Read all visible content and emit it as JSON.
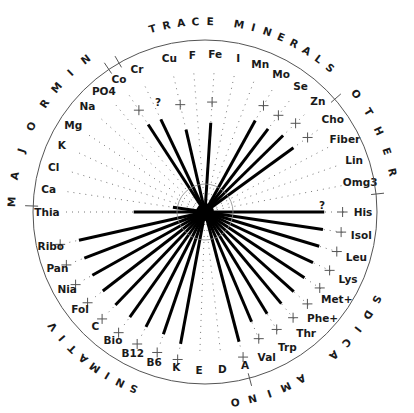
{
  "chart_data": {
    "type": "radial-spoke",
    "title": "",
    "center": [
      205,
      212
    ],
    "outer_radius": 172,
    "reference_radius": 108,
    "inner_circle_radius": 28,
    "reference_marker": "+",
    "value_scale": "spoke length relative to '+' reference (100%)",
    "groups": [
      {
        "name": "MAJOR MIN",
        "label": "MAJOR MIN"
      },
      {
        "name": "TRACE MINERALS",
        "label": "TRACE MINERALS"
      },
      {
        "name": "OTHER",
        "label": "OTHER"
      },
      {
        "name": "AMINO ACIDS",
        "label": "AMINO ACIDS"
      },
      {
        "name": "VITAMINS",
        "label": "VITAMINS"
      }
    ],
    "spokes": [
      {
        "label": "Thia",
        "angle": 180,
        "value": 0.66,
        "marker": false,
        "group": "VITAMINS"
      },
      {
        "label": "Ca",
        "angle": 171.6,
        "value": 0.3,
        "marker": false,
        "dotted": true,
        "group": "MAJOR MIN"
      },
      {
        "label": "Cl",
        "angle": 163.3,
        "value": 0.0,
        "marker": false,
        "dotted": true,
        "group": "MAJOR MIN"
      },
      {
        "label": "K",
        "angle": 154.9,
        "value": 0.0,
        "marker": false,
        "dotted": true,
        "group": "MAJOR MIN"
      },
      {
        "label": "Mg",
        "angle": 146.5,
        "value": 0.0,
        "marker": false,
        "dotted": true,
        "group": "MAJOR MIN"
      },
      {
        "label": "Na",
        "angle": 138.1,
        "value": 0.0,
        "marker": false,
        "dotted": true,
        "group": "MAJOR MIN"
      },
      {
        "label": "PO4",
        "angle": 129.8,
        "value": 0.0,
        "marker": false,
        "dotted": true,
        "group": "MAJOR MIN"
      },
      {
        "label": "Co",
        "angle": 123.0,
        "value": 1.05,
        "marker": true,
        "group": "TRACE MINERALS"
      },
      {
        "label": "Cr",
        "angle": 115.5,
        "value": 0.95,
        "marker": false,
        "note": "?",
        "group": "TRACE MINERALS"
      },
      {
        "label": "Cu",
        "angle": 103.0,
        "value": 0.85,
        "marker": true,
        "group": "TRACE MINERALS"
      },
      {
        "label": "F",
        "angle": 94.6,
        "value": 0.0,
        "marker": false,
        "dotted": true,
        "group": "TRACE MINERALS"
      },
      {
        "label": "Fe",
        "angle": 86.3,
        "value": 0.9,
        "marker": true,
        "group": "TRACE MINERALS"
      },
      {
        "label": "I",
        "angle": 77.9,
        "value": 0.0,
        "marker": false,
        "dotted": true,
        "group": "TRACE MINERALS"
      },
      {
        "label": "Mn",
        "angle": 69.5,
        "value": 0.0,
        "marker": false,
        "dotted": true,
        "group": "TRACE MINERALS"
      },
      {
        "label": "Mo",
        "angle": 61.2,
        "value": 1.05,
        "marker": true,
        "group": "TRACE MINERALS"
      },
      {
        "label": "Se",
        "angle": 52.8,
        "value": 1.05,
        "marker": true,
        "group": "TRACE MINERALS"
      },
      {
        "label": "Zn",
        "angle": 44.4,
        "value": 1.1,
        "marker": true,
        "group": "TRACE MINERALS"
      },
      {
        "label": "Cho",
        "angle": 36.0,
        "value": 1.1,
        "marker": true,
        "group": "OTHER"
      },
      {
        "label": "Fiber",
        "angle": 27.7,
        "value": 0.0,
        "marker": false,
        "dotted": true,
        "group": "OTHER"
      },
      {
        "label": "Lin",
        "angle": 19.3,
        "value": 0.0,
        "marker": false,
        "dotted": true,
        "group": "OTHER"
      },
      {
        "label": "Omg3",
        "angle": 10.9,
        "value": 0.0,
        "marker": false,
        "dotted": true,
        "group": "OTHER"
      },
      {
        "label": "His",
        "angle": 0.0,
        "value": 1.2,
        "marker": true,
        "note": "?",
        "group": "AMINO ACIDS"
      },
      {
        "label": "Isol",
        "angle": -8.4,
        "value": 1.2,
        "marker": true,
        "group": "AMINO ACIDS"
      },
      {
        "label": "Leu",
        "angle": -16.7,
        "value": 1.2,
        "marker": true,
        "group": "AMINO ACIDS"
      },
      {
        "label": "Lys",
        "angle": -25.1,
        "value": 1.2,
        "marker": true,
        "group": "AMINO ACIDS"
      },
      {
        "label": "Met+",
        "angle": -33.5,
        "value": 1.2,
        "marker": true,
        "group": "AMINO ACIDS"
      },
      {
        "label": "Phe+",
        "angle": -41.9,
        "value": 1.2,
        "marker": true,
        "group": "AMINO ACIDS"
      },
      {
        "label": "Thr",
        "angle": -50.2,
        "value": 1.2,
        "marker": true,
        "group": "AMINO ACIDS"
      },
      {
        "label": "Trp",
        "angle": -58.6,
        "value": 1.2,
        "marker": true,
        "group": "AMINO ACIDS"
      },
      {
        "label": "Val",
        "angle": -67.0,
        "value": 1.2,
        "marker": true,
        "group": "AMINO ACIDS"
      },
      {
        "label": "A",
        "angle": -75.3,
        "value": 1.35,
        "marker": true,
        "group": "VITAMINS"
      },
      {
        "label": "D",
        "angle": -83.7,
        "value": 0.0,
        "marker": false,
        "dotted": true,
        "group": "VITAMINS"
      },
      {
        "label": "E",
        "angle": -92.1,
        "value": 0.0,
        "marker": false,
        "dotted": true,
        "group": "VITAMINS"
      },
      {
        "label": "K",
        "angle": -100.5,
        "value": 1.35,
        "marker": true,
        "group": "VITAMINS"
      },
      {
        "label": "B6",
        "angle": -108.8,
        "value": 1.3,
        "marker": true,
        "group": "VITAMINS"
      },
      {
        "label": "B12",
        "angle": -117.2,
        "value": 1.3,
        "marker": true,
        "group": "VITAMINS"
      },
      {
        "label": "Bio",
        "angle": -125.6,
        "value": 1.3,
        "marker": true,
        "group": "VITAMINS"
      },
      {
        "label": "C",
        "angle": -133.9,
        "value": 1.3,
        "marker": true,
        "group": "VITAMINS"
      },
      {
        "label": "Fol",
        "angle": -142.3,
        "value": 1.3,
        "marker": true,
        "group": "VITAMINS"
      },
      {
        "label": "Nia",
        "angle": -150.7,
        "value": 1.3,
        "marker": true,
        "group": "VITAMINS"
      },
      {
        "label": "Pan",
        "angle": -159.1,
        "value": 1.3,
        "marker": true,
        "group": "VITAMINS"
      },
      {
        "label": "Ribo",
        "angle": -167.4,
        "value": 1.3,
        "marker": true,
        "group": "VITAMINS"
      }
    ],
    "notes": [
      {
        "text": "?",
        "near": "Cr"
      },
      {
        "text": "?",
        "near": "His"
      }
    ]
  }
}
